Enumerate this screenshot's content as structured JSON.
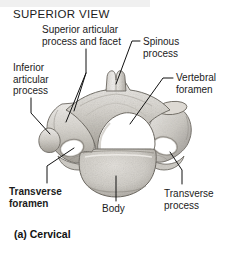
{
  "figure": {
    "view_title": "SUPERIOR VIEW",
    "caption": "(a) Cervical",
    "labels": [
      {
        "id": "superior-articular-process-and-facet",
        "text": "Superior articular\nprocess and facet",
        "bold": false,
        "x": 42,
        "y": 24
      },
      {
        "id": "spinous-process",
        "text": "Spinous\nprocess",
        "bold": false,
        "x": 140,
        "y": 36
      },
      {
        "id": "inferior-articular-process",
        "text": "Inferior\narticular\nprocess",
        "bold": false,
        "x": 14,
        "y": 62
      },
      {
        "id": "vertebral-foramen",
        "text": "Vertebral\nforamen",
        "bold": false,
        "x": 175,
        "y": 72
      },
      {
        "id": "transverse-foramen",
        "text": "Transverse\nforamen",
        "bold": true,
        "x": 9,
        "y": 186
      },
      {
        "id": "body",
        "text": "Body",
        "bold": false,
        "x": 104,
        "y": 204
      },
      {
        "id": "transverse-process",
        "text": "Transverse\nprocess",
        "bold": false,
        "x": 164,
        "y": 188
      }
    ],
    "colors": {
      "ink": "#1b1b1b",
      "leader_line": "#111111",
      "bone_light": "#e8e6e2",
      "bone_mid": "#c8c5bf",
      "bone_dark": "#9a968f",
      "bone_outline": "#6e6a63",
      "foramen_white": "#ffffff",
      "page_background": "#ffffff",
      "top_band": "#f0f0f0"
    }
  }
}
